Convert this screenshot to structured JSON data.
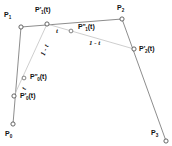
{
  "figure": {
    "width": 172,
    "height": 146,
    "background_color": "#ffffff",
    "line_color": "#808080",
    "helper_line_color": "#b4b4b4",
    "marker_stroke_color": "#555555",
    "marker_fill_color": "#ffffff",
    "text_color": "#111111"
  },
  "control_points": [
    {
      "id": "P0",
      "label_main": "P",
      "label_sub": "0",
      "label_prime": "",
      "x": 13,
      "y": 124,
      "label_x": 6,
      "label_y": 130
    },
    {
      "id": "P1",
      "label_main": "P",
      "label_sub": "1",
      "label_prime": "",
      "x": 21,
      "y": 27,
      "label_x": 5,
      "label_y": 12
    },
    {
      "id": "P2",
      "label_main": "P",
      "label_sub": "2",
      "label_prime": "",
      "x": 122,
      "y": 19,
      "label_x": 118,
      "label_y": 5
    },
    {
      "id": "P3",
      "label_main": "P",
      "label_sub": "3",
      "label_prime": "",
      "x": 166,
      "y": 141,
      "label_x": 152,
      "label_y": 129
    }
  ],
  "first_level_points": [
    {
      "id": "P1prime",
      "label_main": "P",
      "label_sub": "1",
      "label_prime": "'",
      "suffix": "(t)",
      "x": 47,
      "y": 24,
      "label_x": 36,
      "label_y": 7
    },
    {
      "id": "P2prime",
      "label_main": "P",
      "label_sub": "2",
      "label_prime": "'",
      "suffix": "(t)",
      "x": 134,
      "y": 49,
      "label_x": 139,
      "label_y": 45
    },
    {
      "id": "P0prime",
      "label_main": "P",
      "label_sub": "0",
      "label_prime": "'",
      "suffix": "(t)",
      "x": 14,
      "y": 96,
      "label_x": 20,
      "label_y": 92
    }
  ],
  "second_level_points": [
    {
      "id": "P1dprime",
      "label_main": "P",
      "label_sub": "1",
      "label_prime": "''",
      "suffix": "(t)",
      "x": 71,
      "y": 31,
      "label_x": 78,
      "label_y": 23
    },
    {
      "id": "P0dprime",
      "label_main": "P",
      "label_sub": "0",
      "label_prime": "''",
      "suffix": "(t)",
      "x": 24,
      "y": 78,
      "label_x": 30,
      "label_y": 73
    }
  ],
  "parameter_labels": [
    {
      "id": "t-upper",
      "text": "t",
      "x": 57,
      "y": 27,
      "rotated": false
    },
    {
      "id": "one-minus-t-upper-right",
      "text": "1 - t",
      "x": 90,
      "y": 40,
      "rotated": false
    },
    {
      "id": "one-minus-t-left",
      "text": "1 - t",
      "x": 40,
      "y": 54,
      "rotated": true
    },
    {
      "id": "t-lower-left",
      "text": "t",
      "x": 20,
      "y": 88,
      "rotated": true
    }
  ],
  "polygon_edges": [
    {
      "from": "P0",
      "to": "P1"
    },
    {
      "from": "P1",
      "to": "P2"
    },
    {
      "from": "P2",
      "to": "P3"
    }
  ],
  "helper_edges": [
    {
      "from": "P0prime",
      "to": "P1prime",
      "note": "first-level chord left"
    },
    {
      "from": "P1prime",
      "to": "P2prime",
      "note": "first-level chord right"
    }
  ]
}
